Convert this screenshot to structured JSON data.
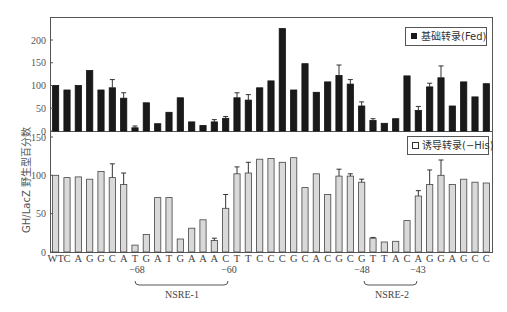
{
  "chart_data": [
    {
      "type": "bar",
      "panel": "top",
      "legend": "基础转录(Fed)",
      "legend_marker": "filled-square",
      "color": "#1a1a1a",
      "ylim": [
        0,
        250
      ],
      "yticks": [
        "0",
        "50",
        "100",
        "150",
        "200"
      ],
      "categories": [
        "WT",
        "C",
        "A",
        "G",
        "G",
        "C",
        "A",
        "T",
        "G",
        "A",
        "T",
        "G",
        "A",
        "A",
        "A",
        "C",
        "T",
        "T",
        "C",
        "C",
        "C",
        "G",
        "C",
        "A",
        "C",
        "G",
        "C",
        "G",
        "T",
        "T",
        "A",
        "C",
        "A",
        "G",
        "G",
        "A",
        "G",
        "C",
        "C"
      ],
      "values": [
        100,
        90,
        100,
        133,
        90,
        95,
        72,
        7,
        62,
        16,
        41,
        73,
        20,
        12,
        20,
        28,
        73,
        68,
        95,
        110,
        225,
        90,
        148,
        85,
        108,
        122,
        103,
        55,
        23,
        17,
        27,
        121,
        45,
        97,
        117,
        55,
        108,
        75,
        104
      ],
      "error_tops": [
        null,
        null,
        null,
        null,
        null,
        113,
        84,
        11,
        null,
        null,
        null,
        null,
        null,
        null,
        25,
        32,
        84,
        80,
        null,
        null,
        null,
        null,
        null,
        null,
        null,
        145,
        113,
        64,
        27,
        null,
        null,
        null,
        54,
        105,
        143,
        null,
        null,
        null,
        null
      ]
    },
    {
      "type": "bar",
      "panel": "bottom",
      "legend": "诱导转录(−His)",
      "legend_marker": "open-square",
      "color": "#d9d9d9",
      "ylim": [
        0,
        150
      ],
      "yticks": [
        "0",
        "50",
        "100",
        "150"
      ],
      "categories": [
        "WT",
        "C",
        "A",
        "G",
        "G",
        "C",
        "A",
        "T",
        "G",
        "A",
        "T",
        "G",
        "A",
        "A",
        "A",
        "C",
        "T",
        "T",
        "C",
        "C",
        "C",
        "G",
        "C",
        "A",
        "C",
        "G",
        "C",
        "G",
        "T",
        "T",
        "A",
        "C",
        "A",
        "G",
        "G",
        "A",
        "G",
        "C",
        "C"
      ],
      "values": [
        100,
        97,
        98,
        95,
        105,
        97,
        88,
        9,
        23,
        71,
        71,
        17,
        31,
        42,
        15,
        57,
        102,
        103,
        121,
        122,
        117,
        123,
        84,
        102,
        75,
        99,
        99,
        91,
        18,
        13,
        14,
        41,
        73,
        88,
        100,
        88,
        95,
        91,
        90
      ],
      "error_tops": [
        null,
        null,
        null,
        null,
        null,
        115,
        103,
        null,
        null,
        null,
        null,
        null,
        null,
        null,
        18,
        75,
        111,
        117,
        null,
        null,
        null,
        null,
        null,
        null,
        null,
        108,
        102,
        95,
        19,
        null,
        null,
        null,
        80,
        107,
        120,
        null,
        null,
        null,
        null
      ]
    }
  ],
  "axis": {
    "ylabel": "GH/LacZ 野生型百分数",
    "xlabels_first": "WT"
  },
  "annotations": {
    "nsre1": {
      "label": "NSRE-1",
      "start": "−68",
      "end": "−60"
    },
    "nsre2": {
      "label": "NSRE-2",
      "start": "−48",
      "end": "−43"
    }
  }
}
